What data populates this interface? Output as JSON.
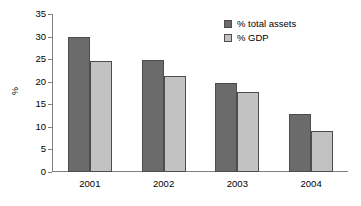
{
  "chart_data": {
    "type": "bar",
    "title": "",
    "subtitle": "",
    "xlabel": "",
    "ylabel": "%",
    "categories": [
      "2001",
      "2002",
      "2003",
      "2004"
    ],
    "series": [
      {
        "name": "% total assets",
        "color": "#6b6b6b",
        "values": [
          30.0,
          24.8,
          19.8,
          12.9
        ]
      },
      {
        "name": "% GDP",
        "color": "#c2c2c2",
        "values": [
          24.5,
          21.3,
          17.7,
          9.1
        ]
      }
    ],
    "ylim": [
      0,
      35
    ],
    "ytick_step": 5,
    "ytick_labels": [
      "0",
      "5",
      "10",
      "15",
      "20",
      "25",
      "30",
      "35"
    ],
    "grid": false,
    "legend_position": "top-right",
    "legend_border": false,
    "plot_border": "left-bottom",
    "orientation": "vertical",
    "grouping": "clustered"
  },
  "axes": {
    "y_title": "%",
    "y_ticks": [
      {
        "value": 35,
        "label": "35"
      },
      {
        "value": 30,
        "label": "30"
      },
      {
        "value": 25,
        "label": "25"
      },
      {
        "value": 20,
        "label": "20"
      },
      {
        "value": 15,
        "label": "15"
      },
      {
        "value": 10,
        "label": "10"
      },
      {
        "value": 5,
        "label": "5"
      },
      {
        "value": 0,
        "label": "0"
      }
    ],
    "x_ticks": [
      "2001",
      "2002",
      "2003",
      "2004"
    ]
  },
  "legend": {
    "items": [
      {
        "label": "% total assets",
        "color": "#6b6b6b"
      },
      {
        "label": "% GDP",
        "color": "#c2c2c2"
      }
    ]
  },
  "colors": {
    "series_total_assets": "#6b6b6b",
    "series_gdp": "#c2c2c2",
    "axis": "#808080",
    "bar_outline": "#4d4d4d",
    "text": "#000000",
    "background": "#ffffff"
  }
}
